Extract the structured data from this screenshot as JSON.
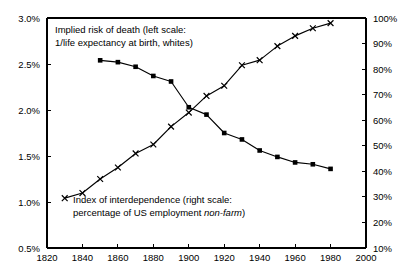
{
  "chart_data": {
    "type": "line",
    "title": "",
    "subtitle": "",
    "xlabel": "",
    "ylabel": "",
    "grid": false,
    "legend_position": "inline-annotation",
    "background_color": "#ffffff",
    "foreground_color": "#000000",
    "x_axis": {
      "min": 1820,
      "max": 2000,
      "tick_step": 20,
      "tick_labels": [
        "1820",
        "1840",
        "1860",
        "1880",
        "1900",
        "1920",
        "1940",
        "1960",
        "1980",
        "2000"
      ],
      "tick_values": [
        1820,
        1840,
        1860,
        1880,
        1900,
        1920,
        1940,
        1960,
        1980,
        2000
      ]
    },
    "y_axis_left": {
      "min": 0.5,
      "max": 3.0,
      "tick_step": 0.5,
      "unit": "%",
      "tick_labels": [
        "0.5%",
        "1.0%",
        "1.5%",
        "2.0%",
        "2.5%",
        "3.0%"
      ],
      "tick_values": [
        0.5,
        1.0,
        1.5,
        2.0,
        2.5,
        3.0
      ]
    },
    "y_axis_right": {
      "min": 10,
      "max": 100,
      "tick_step": 10,
      "unit": "%",
      "tick_labels": [
        "10%",
        "20%",
        "30%",
        "40%",
        "50%",
        "60%",
        "70%",
        "80%",
        "90%",
        "100%"
      ],
      "tick_values": [
        10,
        20,
        30,
        40,
        50,
        60,
        70,
        80,
        90,
        100
      ]
    },
    "series": [
      {
        "name": "Implied risk of death",
        "axis": "left",
        "marker": "filled-square",
        "color": "#000000",
        "x": [
          1850,
          1860,
          1870,
          1880,
          1890,
          1900,
          1910,
          1920,
          1930,
          1940,
          1950,
          1960,
          1970,
          1980
        ],
        "values": [
          2.54,
          2.52,
          2.47,
          2.37,
          2.31,
          2.03,
          1.95,
          1.75,
          1.68,
          1.56,
          1.49,
          1.43,
          1.41,
          1.36
        ]
      },
      {
        "name": "Index of interdependence",
        "axis": "right",
        "marker": "cross",
        "color": "#000000",
        "x": [
          1830,
          1840,
          1850,
          1860,
          1870,
          1880,
          1890,
          1900,
          1910,
          1920,
          1930,
          1940,
          1950,
          1960,
          1970,
          1980
        ],
        "values": [
          29.5,
          31.5,
          37.0,
          41.5,
          47.0,
          50.5,
          57.5,
          63.0,
          69.5,
          73.5,
          81.5,
          83.5,
          89.0,
          93.0,
          96.0,
          98.0
        ]
      }
    ],
    "annotations": {
      "top": {
        "line1": "Implied risk of death (left scale:",
        "line2": "1/life expectancy at birth, whites)"
      },
      "bottom": {
        "line1": "Index of interdependence (right scale:",
        "line2_prefix": "percentage of US employment ",
        "line2_italic": "non-farm",
        "line2_suffix": ")"
      }
    }
  }
}
